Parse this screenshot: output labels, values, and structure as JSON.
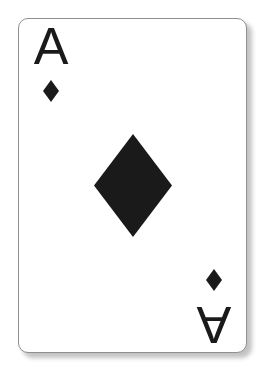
{
  "scene": {
    "background_color": "#ffffff",
    "width": 270,
    "height": 382
  },
  "card": {
    "name": "Ace of Diamonds",
    "rank": "A",
    "rank_name": "Ace",
    "suit": "diamonds",
    "suit_symbol": "♦",
    "suit_color": "#1a1a1a",
    "face_color": "#ffffff",
    "border_color": "#8f8f8f",
    "shadow_color": "#b9b9b9",
    "corner_radius_px": 10,
    "orientation": "upright",
    "indices": {
      "top_left": {
        "rank": "A",
        "pip": "♦",
        "rotation_deg": 0
      },
      "bottom_right": {
        "rank": "A",
        "pip": "♦",
        "rotation_deg": 180
      }
    },
    "center_pip": {
      "symbol": "♦",
      "count": 1,
      "width_px": 77,
      "height_px": 102
    }
  }
}
